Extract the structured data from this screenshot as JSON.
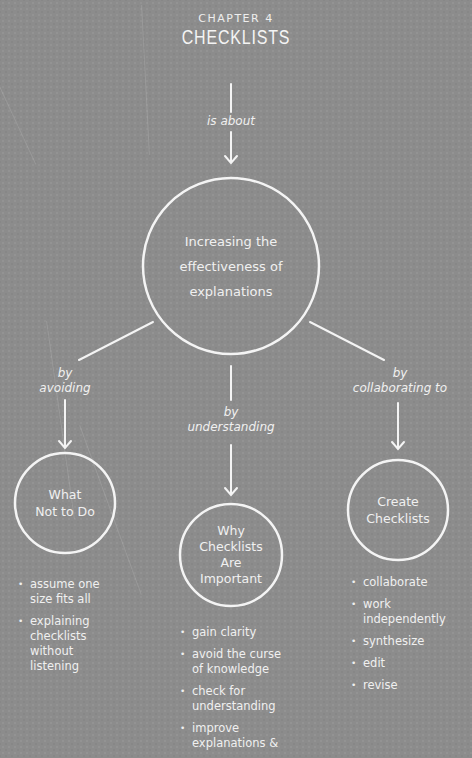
{
  "header": {
    "chapter_label": "CHAPTER 4",
    "chapter_title": "CHECKLISTS"
  },
  "connectors": {
    "main": "is about",
    "left_1": "by",
    "left_2": "avoiding",
    "middle_1": "by",
    "middle_2": "understanding",
    "right_1": "by",
    "right_2": "collaborating to"
  },
  "center_node": {
    "line1": "Increasing the",
    "line2": "effectiveness of",
    "line3": "explanations"
  },
  "left_node": {
    "line1": "What",
    "line2": "Not to Do",
    "bullets": [
      "assume one size fits all",
      "explaining checklists without listening"
    ]
  },
  "middle_node": {
    "line1": "Why",
    "line2": "Checklists",
    "line3": "Are",
    "line4": "Important",
    "bullets": [
      "gain clarity",
      "avoid the curse of knowledge",
      "check for understanding",
      "improve explanations &"
    ]
  },
  "right_node": {
    "line1": "Create",
    "line2": "Checklists",
    "bullets": [
      "collaborate",
      "work independently",
      "synthesize",
      "edit",
      "revise"
    ]
  },
  "colors": {
    "background": "#8c8c8c",
    "foreground": "#f2f2f2"
  }
}
